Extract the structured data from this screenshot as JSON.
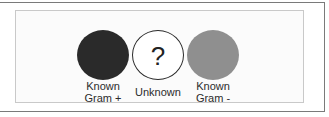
{
  "figure": {
    "items": [
      {
        "label_line1": "Known",
        "label_line2": "Gram +",
        "fill": "#2a2a2a",
        "symbol": ""
      },
      {
        "label_line1": "Unknown",
        "label_line2": "",
        "fill": "#ffffff",
        "symbol": "?"
      },
      {
        "label_line1": "Known",
        "label_line2": "Gram -",
        "fill": "#8f8f8f",
        "symbol": ""
      }
    ]
  }
}
